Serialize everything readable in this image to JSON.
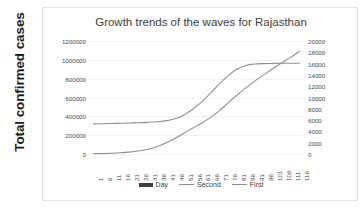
{
  "chart_data": {
    "type": "line",
    "title": "Growth trends of the waves for Rajasthan",
    "xlabel": "",
    "ylabel": "Total confirmed cases",
    "y2label": "",
    "grid": true,
    "legend_position": "bottom",
    "x": [
      1,
      6,
      11,
      16,
      21,
      26,
      31,
      36,
      41,
      46,
      51,
      56,
      61,
      66,
      71,
      76,
      81,
      86,
      91,
      96,
      101,
      106,
      111,
      116
    ],
    "xticklabels": [
      "1",
      "6",
      "11",
      "16",
      "21",
      "26",
      "31",
      "36",
      "41",
      "46",
      "51",
      "56",
      "61",
      "66",
      "71",
      "76",
      "81",
      "86",
      "91",
      "96",
      "101",
      "106",
      "111",
      "116"
    ],
    "ylim": [
      0,
      1200000
    ],
    "yticks": [
      0,
      200000,
      400000,
      600000,
      800000,
      1000000,
      1200000
    ],
    "yticklabels": [
      "0",
      "200000",
      "400000",
      "600000",
      "800000",
      "1000000",
      "1200000"
    ],
    "y2lim": [
      0,
      20000
    ],
    "y2ticks": [
      0,
      2000,
      4000,
      6000,
      8000,
      10000,
      12000,
      14000,
      16000,
      18000,
      20000
    ],
    "y2ticklabels": [
      "0",
      "2000",
      "4000",
      "6000",
      "8000",
      "10000",
      "12000",
      "14000",
      "16000",
      "18000",
      "20000"
    ],
    "series": [
      {
        "name": "Second",
        "axis": "left",
        "color": "#8f8f8f",
        "values": [
          320000,
          322000,
          324000,
          326000,
          329000,
          332000,
          336000,
          342000,
          352000,
          372000,
          410000,
          470000,
          545000,
          640000,
          740000,
          830000,
          900000,
          940000,
          955000,
          960000,
          962000,
          963000,
          963000,
          963000
        ]
      },
      {
        "name": "First",
        "axis": "right",
        "color": "#8f8f8f",
        "values": [
          60,
          90,
          140,
          220,
          340,
          520,
          800,
          1250,
          1900,
          2700,
          3600,
          4500,
          5400,
          6400,
          7600,
          9000,
          10400,
          11700,
          12900,
          14000,
          15100,
          16100,
          17100,
          18200
        ]
      }
    ],
    "legend": [
      {
        "label": "Day",
        "marker": "bar",
        "color": "#404040"
      },
      {
        "label": "Second",
        "marker": "line",
        "color": "#8f8f8f"
      },
      {
        "label": "First",
        "marker": "line",
        "color": "#8f8f8f"
      }
    ]
  }
}
